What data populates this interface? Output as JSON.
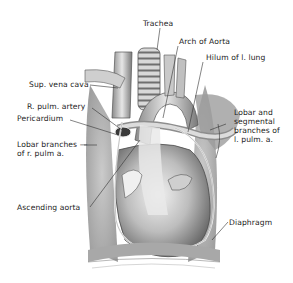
{
  "figure": {
    "colors": {
      "background": "#ffffff",
      "ink": "#222222",
      "tissue_light": "#d9d9d9",
      "tissue_mid": "#9a9a9a",
      "tissue_dark": "#555555",
      "pericardium_line": "#f4f4f4"
    },
    "labels": [
      {
        "id": "trachea",
        "text": "Trachea"
      },
      {
        "id": "arch_of_aorta",
        "text": "Arch of Aorta"
      },
      {
        "id": "hilum_l_lung",
        "text": "Hilum of l. lung"
      },
      {
        "id": "sup_vena_cava",
        "text": "Sup. vena cava"
      },
      {
        "id": "r_pulm_artery",
        "text": "R. pulm. artery"
      },
      {
        "id": "pericardium",
        "text": "Pericardium"
      },
      {
        "id": "lobar_segmental_l",
        "lines": [
          "Lobar and",
          "segmental",
          "branches of",
          "l. pulm. a."
        ]
      },
      {
        "id": "lobar_r",
        "lines": [
          "Lobar branches —",
          "of r. pulm a."
        ]
      },
      {
        "id": "ascending_aorta",
        "text": "Ascending aorta"
      },
      {
        "id": "diaphragm",
        "text": "Diaphragm"
      }
    ]
  }
}
